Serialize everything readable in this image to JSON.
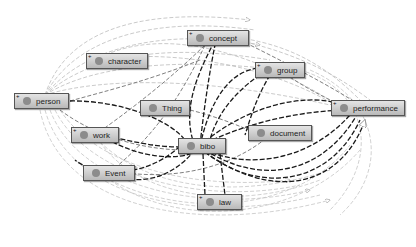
{
  "graph": {
    "nodes": [
      {
        "id": "concept",
        "label": "concept",
        "x": 187,
        "y": 30,
        "w": 62,
        "expandable": true
      },
      {
        "id": "character",
        "label": "character",
        "x": 86,
        "y": 53,
        "w": 62,
        "expandable": true
      },
      {
        "id": "group",
        "label": "group",
        "x": 255,
        "y": 62,
        "w": 50,
        "expandable": true
      },
      {
        "id": "person",
        "label": "person",
        "x": 14,
        "y": 93,
        "w": 55,
        "expandable": true
      },
      {
        "id": "performance",
        "label": "performance",
        "x": 331,
        "y": 100,
        "w": 74,
        "expandable": true
      },
      {
        "id": "Thing",
        "label": "Thing",
        "x": 140,
        "y": 100,
        "w": 50,
        "expandable": false
      },
      {
        "id": "work",
        "label": "work",
        "x": 71,
        "y": 127,
        "w": 48,
        "expandable": true
      },
      {
        "id": "bibo",
        "label": "bibo",
        "x": 178,
        "y": 138,
        "w": 48,
        "expandable": false
      },
      {
        "id": "document",
        "label": "document",
        "x": 248,
        "y": 125,
        "w": 64,
        "expandable": false
      },
      {
        "id": "Event",
        "label": "Event",
        "x": 83,
        "y": 165,
        "w": 52,
        "expandable": false
      },
      {
        "id": "law",
        "label": "law",
        "x": 197,
        "y": 194,
        "w": 45,
        "expandable": true
      }
    ],
    "expand_glyph": "+",
    "colors": {
      "edge_dark": "#1a1a1a",
      "edge_mid": "#777777",
      "edge_light": "#bdbdbd",
      "node_border": "#555555",
      "node_dot": "#8c8c8c"
    }
  }
}
